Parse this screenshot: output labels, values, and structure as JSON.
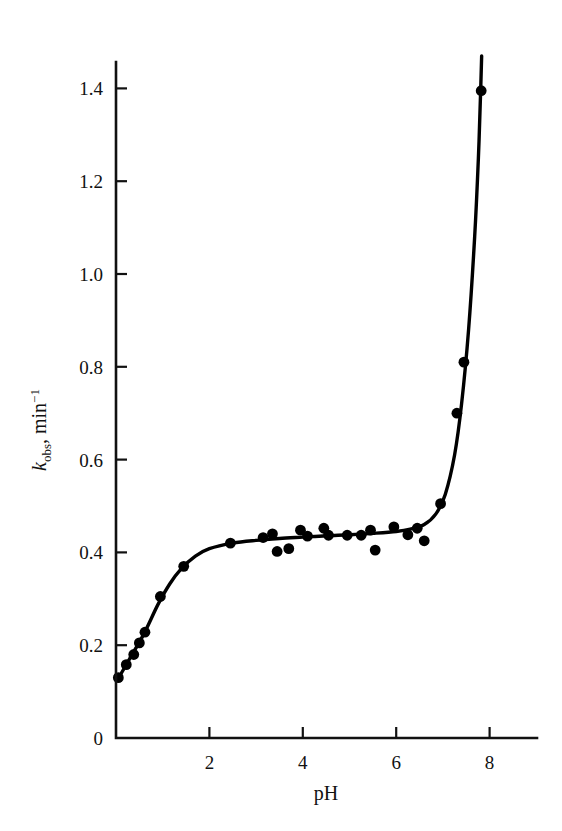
{
  "chart_data": {
    "type": "scatter",
    "title": "",
    "subtitle": "",
    "xlabel": "pH",
    "ylabel_parts": {
      "symbol": "k",
      "subscript": "obs",
      "separator": ", min",
      "superscript": "−1"
    },
    "ylabel": "k obs, min -1",
    "xlim": [
      0,
      9
    ],
    "ylim": [
      0,
      1.5
    ],
    "xticks": [
      2,
      4,
      6,
      8
    ],
    "xticklabels": [
      "2",
      "4",
      "6",
      "8"
    ],
    "yticks": [
      0,
      0.2,
      0.4,
      0.6,
      0.8,
      1.0,
      1.2,
      1.4
    ],
    "yticklabels": [
      "0",
      "0.2",
      "0.4",
      "0.6",
      "0.8",
      "1.0",
      "1.2",
      "1.4"
    ],
    "grid": false,
    "legend": null,
    "tick_direction": "in",
    "marker": "filled-circle",
    "marker_color": "#000000",
    "line_color": "#000000",
    "points": [
      {
        "pH": 0.05,
        "k": 0.13
      },
      {
        "pH": 0.22,
        "k": 0.158
      },
      {
        "pH": 0.38,
        "k": 0.18
      },
      {
        "pH": 0.5,
        "k": 0.205
      },
      {
        "pH": 0.62,
        "k": 0.228
      },
      {
        "pH": 0.95,
        "k": 0.305
      },
      {
        "pH": 1.45,
        "k": 0.37
      },
      {
        "pH": 2.45,
        "k": 0.42
      },
      {
        "pH": 3.15,
        "k": 0.432
      },
      {
        "pH": 3.35,
        "k": 0.44
      },
      {
        "pH": 3.45,
        "k": 0.402
      },
      {
        "pH": 3.7,
        "k": 0.408
      },
      {
        "pH": 3.95,
        "k": 0.448
      },
      {
        "pH": 4.1,
        "k": 0.435
      },
      {
        "pH": 4.45,
        "k": 0.452
      },
      {
        "pH": 4.55,
        "k": 0.437
      },
      {
        "pH": 4.95,
        "k": 0.437
      },
      {
        "pH": 5.25,
        "k": 0.437
      },
      {
        "pH": 5.45,
        "k": 0.448
      },
      {
        "pH": 5.55,
        "k": 0.405
      },
      {
        "pH": 5.95,
        "k": 0.455
      },
      {
        "pH": 6.25,
        "k": 0.438
      },
      {
        "pH": 6.45,
        "k": 0.452
      },
      {
        "pH": 6.6,
        "k": 0.425
      },
      {
        "pH": 6.95,
        "k": 0.505
      },
      {
        "pH": 7.3,
        "k": 0.7
      },
      {
        "pH": 7.45,
        "k": 0.81
      },
      {
        "pH": 7.82,
        "k": 1.395
      }
    ],
    "curve": [
      {
        "pH": 0.03,
        "k": 0.125
      },
      {
        "pH": 0.3,
        "k": 0.172
      },
      {
        "pH": 0.6,
        "k": 0.225
      },
      {
        "pH": 0.9,
        "k": 0.288
      },
      {
        "pH": 1.15,
        "k": 0.332
      },
      {
        "pH": 1.4,
        "k": 0.365
      },
      {
        "pH": 1.7,
        "k": 0.392
      },
      {
        "pH": 2.0,
        "k": 0.408
      },
      {
        "pH": 2.5,
        "k": 0.42
      },
      {
        "pH": 3.0,
        "k": 0.426
      },
      {
        "pH": 3.5,
        "k": 0.43
      },
      {
        "pH": 4.0,
        "k": 0.433
      },
      {
        "pH": 4.5,
        "k": 0.436
      },
      {
        "pH": 5.0,
        "k": 0.438
      },
      {
        "pH": 5.5,
        "k": 0.441
      },
      {
        "pH": 6.0,
        "k": 0.445
      },
      {
        "pH": 6.3,
        "k": 0.45
      },
      {
        "pH": 6.6,
        "k": 0.46
      },
      {
        "pH": 6.85,
        "k": 0.483
      },
      {
        "pH": 7.05,
        "k": 0.525
      },
      {
        "pH": 7.25,
        "k": 0.61
      },
      {
        "pH": 7.4,
        "k": 0.72
      },
      {
        "pH": 7.55,
        "k": 0.88
      },
      {
        "pH": 7.68,
        "k": 1.08
      },
      {
        "pH": 7.76,
        "k": 1.25
      },
      {
        "pH": 7.81,
        "k": 1.4
      },
      {
        "pH": 7.83,
        "k": 1.47
      }
    ]
  }
}
